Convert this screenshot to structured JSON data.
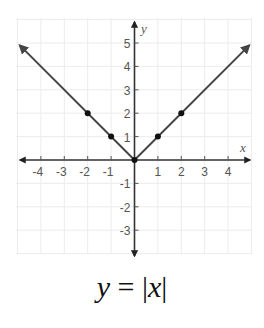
{
  "chart_data": {
    "type": "line",
    "title": "y = |x|",
    "xlabel": "x",
    "ylabel": "y",
    "xlim": [
      -4.5,
      4.5
    ],
    "ylim": [
      -3.5,
      5.5
    ],
    "grid": true,
    "x_ticks": [
      -4,
      -3,
      -2,
      -1,
      1,
      2,
      3,
      4
    ],
    "y_ticks": [
      5,
      4,
      3,
      2,
      1,
      -1,
      -2,
      -3
    ],
    "series": [
      {
        "name": "y = |x|",
        "x": [
          -4.9,
          -2,
          -1,
          0,
          1,
          2,
          4.9
        ],
        "y": [
          4.9,
          2,
          1,
          0,
          1,
          2,
          4.9
        ],
        "marked_points": [
          {
            "x": -2,
            "y": 2
          },
          {
            "x": -1,
            "y": 1
          },
          {
            "x": 0,
            "y": 0
          },
          {
            "x": 1,
            "y": 1
          },
          {
            "x": 2,
            "y": 2
          }
        ],
        "arrows_at_ends": true
      }
    ]
  },
  "labels": {
    "x_axis": "x",
    "y_axis": "y",
    "equation_lhs": "y",
    "equation_eq": " = ",
    "equation_bar_left": "|",
    "equation_var": "x",
    "equation_bar_right": "|"
  },
  "colors": {
    "line": "#444444",
    "axis": "#333333",
    "grid": "#ececec"
  }
}
